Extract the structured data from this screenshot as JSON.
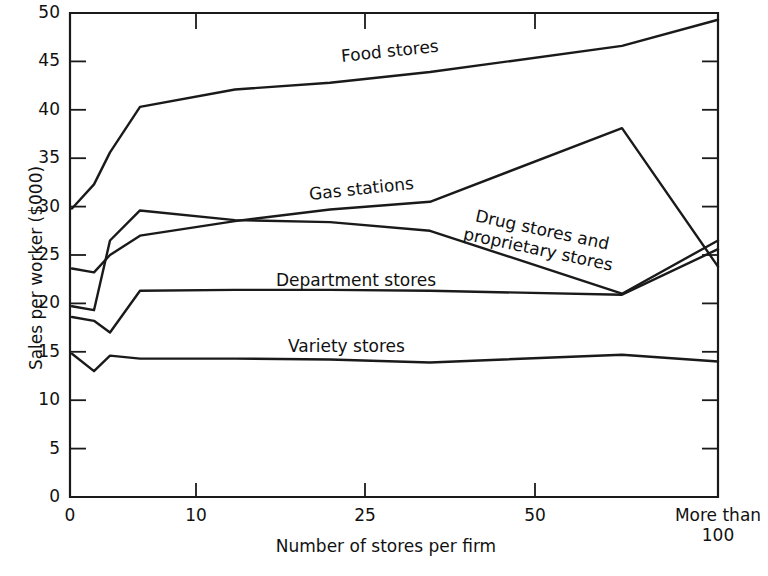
{
  "chart_data": {
    "type": "line",
    "title": "",
    "xlabel": "Number of stores per firm",
    "ylabel": "Sales per worker ($000)",
    "x_tick_labels": [
      "0",
      "10",
      "25",
      "50",
      "More than\n100"
    ],
    "x_tick_values": [
      0,
      10,
      25,
      50,
      110
    ],
    "y_tick_labels": [
      "0",
      "5",
      "10",
      "15",
      "20",
      "25",
      "30",
      "35",
      "40",
      "45",
      "50"
    ],
    "y_tick_values": [
      0,
      5,
      10,
      15,
      20,
      25,
      30,
      35,
      40,
      45,
      50
    ],
    "ylim": [
      0,
      50
    ],
    "grid": false,
    "legend": "inline-labels",
    "x_positions_px": [
      72,
      94,
      110,
      140,
      235,
      330,
      430,
      622,
      718
    ],
    "series": [
      {
        "name": "Food stores",
        "label": "Food stores",
        "values": [
          29.8,
          32.3,
          35.6,
          40.3,
          42.1,
          42.8,
          43.9,
          46.6,
          49.3
        ]
      },
      {
        "name": "Gas stations",
        "label": "Gas stations",
        "values": [
          23.6,
          23.2,
          25.0,
          27.0,
          28.5,
          29.7,
          30.5,
          38.1,
          23.8
        ]
      },
      {
        "name": "Drug stores and proprietary stores",
        "label": "Drug stores and proprietary stores",
        "label_line_1": "Drug stores and",
        "label_line_2": "proprietary stores",
        "values": [
          19.7,
          19.3,
          26.5,
          29.6,
          28.6,
          28.4,
          27.5,
          21.0,
          26.5
        ]
      },
      {
        "name": "Department stores",
        "label": "Department stores",
        "values": [
          18.6,
          18.2,
          17.0,
          21.3,
          21.4,
          21.4,
          21.3,
          20.9,
          25.6
        ]
      },
      {
        "name": "Variety stores",
        "label": "Variety stores",
        "values": [
          14.8,
          13.0,
          14.6,
          14.3,
          14.3,
          14.2,
          13.9,
          14.7,
          14.0
        ]
      }
    ],
    "series_label_placement": [
      {
        "name": "Food stores",
        "x_px": 340,
        "y_px": 46,
        "rotation_deg": -6
      },
      {
        "name": "Gas stations",
        "x_px": 308,
        "y_px": 184,
        "rotation_deg": -6
      },
      {
        "name": "Drug stores and proprietary stores",
        "x_px": 470,
        "y_px": 204,
        "rotation_deg": 12
      },
      {
        "name": "Department stores",
        "x_px": 276,
        "y_px": 270,
        "rotation_deg": 0
      },
      {
        "name": "Variety stores",
        "x_px": 288,
        "y_px": 336,
        "rotation_deg": 0
      }
    ],
    "colors": {
      "line": "#1a1a1a",
      "axis": "#1a1a1a",
      "background": "#ffffff"
    }
  }
}
